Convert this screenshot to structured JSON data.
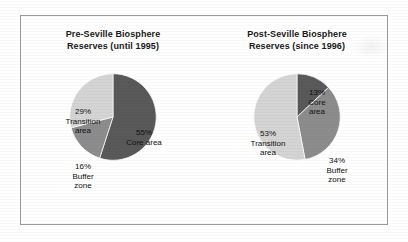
{
  "figure": {
    "background_color": "#ffffff",
    "frame_color": "#9a9a9a"
  },
  "palette": {
    "core": "#595959",
    "buffer": "#8c8c8c",
    "transition": "#d4d4d4",
    "slice_outline": "#ffffff",
    "text": "#111111"
  },
  "panels": [
    {
      "id": "pre-seville",
      "title_line1": "Pre-Seville Biosphere",
      "title_line2": "Reserves (until 1995)"
    },
    {
      "id": "post-seville",
      "title_line1": "Post-Seville Biosphere",
      "title_line2": "Reserves (since 1996)"
    }
  ],
  "labels": {
    "pre": {
      "core": {
        "pct": "55%",
        "name_line1": "Core area",
        "name_line2": ""
      },
      "transition": {
        "pct": "29%",
        "name_line1": "Transition",
        "name_line2": "area"
      },
      "buffer": {
        "pct": "16%",
        "name_line1": "Buffer",
        "name_line2": "zone"
      }
    },
    "post": {
      "core": {
        "pct": "13%",
        "name_line1": "Core",
        "name_line2": "area"
      },
      "buffer": {
        "pct": "34%",
        "name_line1": "Buffer",
        "name_line2": "zone"
      },
      "transition": {
        "pct": "53%",
        "name_line1": "Transition",
        "name_line2": "area"
      }
    }
  },
  "chart_data": [
    {
      "type": "pie",
      "title": "Pre-Seville Biosphere Reserves (until 1995)",
      "categories": [
        "Core area",
        "Buffer zone",
        "Transition area"
      ],
      "values": [
        55,
        16,
        29
      ],
      "unit": "percent",
      "colors": [
        "#595959",
        "#8c8c8c",
        "#d4d4d4"
      ],
      "start_angle_deg": 0,
      "direction": "clockwise",
      "legend": "none",
      "labels_inside_slices": true,
      "slices": [
        {
          "label": "Core area",
          "value": 55,
          "display": "55% Core area",
          "color": "#595959"
        },
        {
          "label": "Buffer zone",
          "value": 16,
          "display": "16% Buffer zone",
          "color": "#8c8c8c"
        },
        {
          "label": "Transition area",
          "value": 29,
          "display": "29% Transition area",
          "color": "#d4d4d4"
        }
      ]
    },
    {
      "type": "pie",
      "title": "Post-Seville Biosphere Reserves (since 1996)",
      "categories": [
        "Core area",
        "Buffer zone",
        "Transition area"
      ],
      "values": [
        13,
        34,
        53
      ],
      "unit": "percent",
      "colors": [
        "#595959",
        "#8c8c8c",
        "#d4d4d4"
      ],
      "start_angle_deg": 0,
      "direction": "clockwise",
      "legend": "none",
      "labels_inside_slices": true,
      "slices": [
        {
          "label": "Core area",
          "value": 13,
          "display": "13% Core area",
          "color": "#595959"
        },
        {
          "label": "Buffer zone",
          "value": 34,
          "display": "34% Buffer zone",
          "color": "#8c8c8c"
        },
        {
          "label": "Transition area",
          "value": 53,
          "display": "53% Transition area",
          "color": "#d4d4d4"
        }
      ]
    }
  ]
}
